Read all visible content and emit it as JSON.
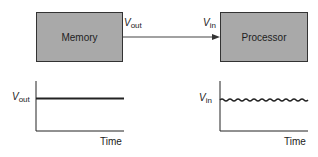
{
  "blocks": {
    "memory": {
      "label": "Memory",
      "fill": "#a9a9a9"
    },
    "processor": {
      "label": "Processor",
      "fill": "#a9a9a9"
    }
  },
  "signals": {
    "vout": {
      "symbol": "V",
      "subscript": "out"
    },
    "vin": {
      "symbol": "V",
      "subscript": "in"
    }
  },
  "graphs": {
    "left": {
      "y_label_symbol": "V",
      "y_label_sub": "out",
      "x_label": "Time",
      "waveform": "flat"
    },
    "right": {
      "y_label_symbol": "V",
      "y_label_sub": "in",
      "x_label": "Time",
      "waveform": "ripple"
    }
  }
}
